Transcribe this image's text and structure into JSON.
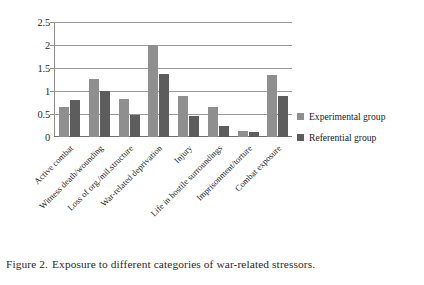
{
  "caption": {
    "number": "Figure 2.",
    "text": "Exposure to different categories of war-related stressors."
  },
  "legend": {
    "position": "right",
    "items": [
      {
        "label": "Experimental group",
        "color": "#8f8f8f"
      },
      {
        "label": "Referential group",
        "color": "#5d5d5d"
      }
    ]
  },
  "chart_data": {
    "type": "bar",
    "title": "",
    "xlabel": "",
    "ylabel": "",
    "ylim": [
      0,
      2.5
    ],
    "yticks": [
      0,
      0.5,
      1,
      1.5,
      2,
      2.5
    ],
    "ytick_labels": [
      "0",
      "0.5",
      "1",
      "1.5",
      "2",
      "2.5"
    ],
    "grid": true,
    "categories": [
      "Active combat",
      "Witness death/wounding",
      "Loss of org./mil.structure",
      "War-related deprivation",
      "Injury",
      "Life in hostile surroundings",
      "Imprisonment/torture",
      "Combat exposure"
    ],
    "series": [
      {
        "name": "Experimental group",
        "color": "#8f8f8f",
        "values": [
          0.65,
          1.27,
          0.83,
          2.0,
          0.9,
          0.65,
          0.12,
          1.35
        ]
      },
      {
        "name": "Referential group",
        "color": "#5d5d5d",
        "values": [
          0.81,
          1.0,
          0.48,
          1.37,
          0.45,
          0.25,
          0.1,
          0.9
        ]
      }
    ]
  }
}
